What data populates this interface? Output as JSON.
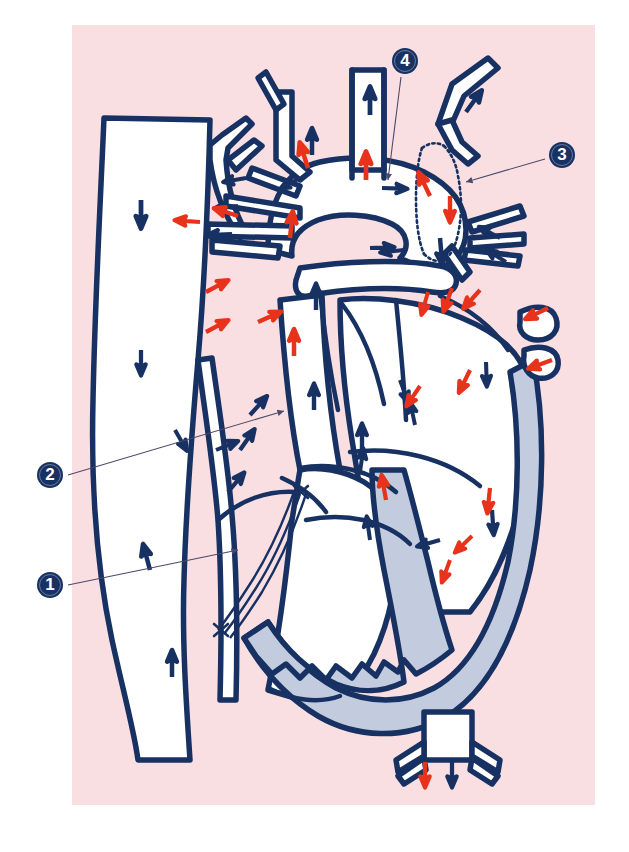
{
  "figure": {
    "kind": "anatomical-diagram",
    "panel_background": "#fadfe2",
    "page_background": "#ffffff",
    "vessel_outline_color": "#173163",
    "vessel_fill_color": "#ffffff",
    "myocardium_fill_color": "#c3ccdf",
    "arterial_arrow_color": "#e8331c",
    "venous_arrow_color": "#173163",
    "leader_line_color": "#4a4a6a",
    "panel_rect": {
      "x": 72,
      "y": 25,
      "w": 523,
      "h": 780
    }
  },
  "callouts": [
    {
      "id": "callout-1",
      "number": "1",
      "circle": {
        "x": 37,
        "y": 572
      },
      "leader_from": {
        "x": 68,
        "y": 585
      },
      "leader_to": {
        "x": 240,
        "y": 550
      },
      "points_to": "lower-anastomosis-suture"
    },
    {
      "id": "callout-2",
      "number": "2",
      "circle": {
        "x": 37,
        "y": 462
      },
      "leader_from": {
        "x": 68,
        "y": 475
      },
      "leader_to": {
        "x": 286,
        "y": 410
      },
      "points_to": "conduit-graft"
    },
    {
      "id": "callout-3",
      "number": "3",
      "circle": {
        "x": 549,
        "y": 142
      },
      "leader_from": {
        "x": 545,
        "y": 158
      },
      "leader_to": {
        "x": 465,
        "y": 182
      },
      "points_to": "stippled-shunt-tube"
    },
    {
      "id": "callout-4",
      "number": "4",
      "circle": {
        "x": 392,
        "y": 48
      },
      "leader_from": {
        "x": 400,
        "y": 76
      },
      "leader_to": {
        "x": 388,
        "y": 182
      },
      "points_to": "aortic-arch-junction"
    }
  ],
  "flow_arrows": {
    "venous_count": 26,
    "arterial_count": 24,
    "legend": {
      "venous": "blue arrow = deoxygenated / systemic venous flow",
      "arterial": "red arrow = oxygenated / arterial flow"
    }
  }
}
